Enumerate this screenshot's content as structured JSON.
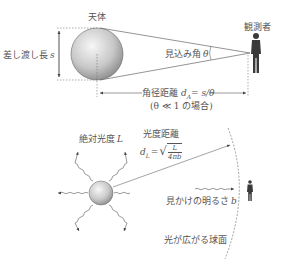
{
  "top_diagram": {
    "title": "角径距離",
    "labels": {
      "body": "天体",
      "observer": "観測者",
      "proper_length": "差し渡し長",
      "proper_length_symbol": "s",
      "apparent_angle": "見込み角",
      "apparent_angle_symbol": "θ",
      "angular_distance": "角径距離",
      "angular_distance_formula": "d",
      "angular_distance_sub": "A",
      "angular_distance_rhs": "= s/θ",
      "condition": "(θ ≪ 1 の場合)"
    }
  },
  "bottom_diagram": {
    "title": "光度距離",
    "labels": {
      "absolute_luminosity": "絶対光度",
      "absolute_luminosity_symbol": "L",
      "luminosity_distance": "光度距離",
      "luminosity_distance_lhs": "d",
      "luminosity_distance_sub": "L",
      "equals": "=",
      "frac_num": "L",
      "frac_den": "4πb",
      "apparent_brightness": "見かけの明るさ",
      "apparent_brightness_symbol": "b",
      "sphere": "光が広がる球面"
    }
  },
  "colors": {
    "line": "#555555",
    "sphere_light": "#f4f4f4",
    "sphere_dark": "#8e8e8e",
    "figure": "#3a3a3a"
  }
}
